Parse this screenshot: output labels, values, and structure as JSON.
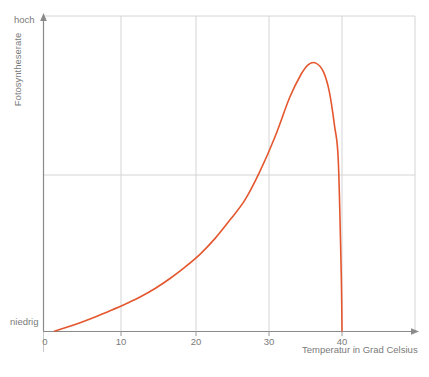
{
  "chart_data": {
    "type": "line",
    "title": "",
    "xlabel": "Temperatur in Grad Celsius",
    "ylabel": "Fotosyntheserate",
    "xlim": [
      0,
      50
    ],
    "ylim": [
      0,
      1
    ],
    "grid": true,
    "legend": "none",
    "x_tick_labels": [
      "0",
      "10",
      "20",
      "30",
      "40"
    ],
    "x_tick_values": [
      0,
      10,
      20,
      30,
      40
    ],
    "y_tick_labels": [
      "niedrig",
      "hoch"
    ],
    "y_tick_values": [
      0,
      1
    ],
    "series": [
      {
        "name": "Fotosyntheserate",
        "color": "#e4572e",
        "x": [
          1.5,
          3,
          5,
          7,
          9,
          11,
          13,
          15,
          17,
          19,
          21,
          23,
          25,
          27,
          29,
          31,
          33,
          34.5,
          35.5,
          36.5,
          37.5,
          38.3,
          39,
          39.5,
          39.9,
          40
        ],
        "values": [
          0.0,
          0.012,
          0.03,
          0.05,
          0.072,
          0.095,
          0.12,
          0.15,
          0.185,
          0.225,
          0.27,
          0.325,
          0.39,
          0.46,
          0.56,
          0.68,
          0.82,
          0.9,
          0.935,
          0.94,
          0.91,
          0.84,
          0.72,
          0.6,
          0.2,
          0.0
        ]
      }
    ]
  },
  "labels": {
    "y_high": "hoch",
    "y_low": "niedrig",
    "y_axis_title": "Fotosyntheserate",
    "x_axis_title": "Temperatur in Grad Celsius",
    "x_tick_0": "0",
    "x_tick_10": "10",
    "x_tick_20": "20",
    "x_tick_30": "30",
    "x_tick_40": "40"
  },
  "colors": {
    "curve": "#e4572e",
    "axis": "#8a8a8a",
    "grid": "#d4d4d4",
    "text": "#7a7a7a"
  }
}
